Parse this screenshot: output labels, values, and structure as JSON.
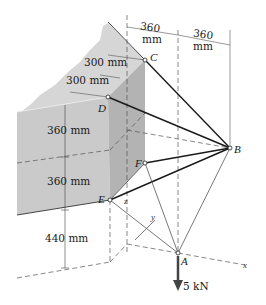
{
  "figure": {
    "type": "3D statics diagram"
  },
  "dimensions": {
    "top_left": {
      "value": "360",
      "unit": "mm"
    },
    "top_right": {
      "value": "360",
      "unit": "mm"
    },
    "wall_upper": "300 mm",
    "wall_lower": "300 mm",
    "vertical_1": "360 mm",
    "vertical_2": "360 mm",
    "vertical_3": "440 mm"
  },
  "points": {
    "A": "A",
    "B": "B",
    "C": "C",
    "D": "D",
    "E": "E",
    "F": "F"
  },
  "axes": {
    "x": "x",
    "y": "y",
    "z": "z"
  },
  "load": {
    "label": "5 kN"
  },
  "colors": {
    "wall_top": "#d4d4d4",
    "wall_front": "#c9c9c9",
    "wall_side": "#b2b2b2",
    "line": "#1a1a1a",
    "thin": "#555555"
  }
}
